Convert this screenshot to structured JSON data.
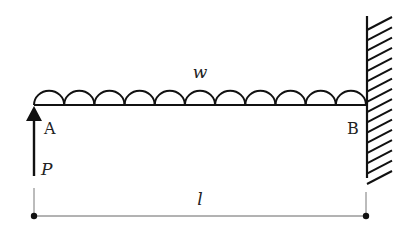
{
  "diagram": {
    "labels": {
      "load": "w",
      "left_end": "A",
      "right_end": "B",
      "force": "P",
      "length": "l"
    },
    "beam": {
      "x_start": 34,
      "x_end": 366,
      "y": 105
    },
    "distributed_load": {
      "hump_count": 11
    },
    "wall": {
      "x": 367,
      "y_top": 16,
      "y_bottom": 178,
      "hatch_count": 16
    },
    "force_arrow": {
      "x": 34,
      "y_tail": 176,
      "y_tip": 106,
      "direction": "up"
    },
    "dimension": {
      "y": 216,
      "x_start": 34,
      "x_end": 366,
      "tick_top": 192
    },
    "colors": {
      "stroke": "#111111",
      "background": "#ffffff"
    }
  }
}
